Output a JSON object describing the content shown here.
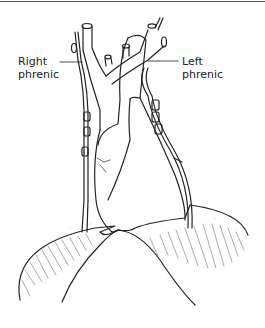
{
  "figure": {
    "labels": {
      "right": {
        "line1": "Right",
        "line2": "phrenic"
      },
      "left": {
        "line1": "Left",
        "line2": "phrenic"
      }
    },
    "colors": {
      "line": "#222222",
      "background": "#ffffff",
      "rule": "#555555"
    }
  }
}
